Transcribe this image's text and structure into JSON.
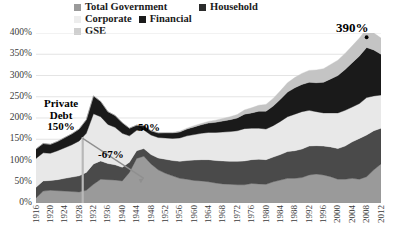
{
  "legend": {
    "items": [
      {
        "label": "Total Government",
        "color": "#9a9a9a",
        "key": "total_government"
      },
      {
        "label": "Household",
        "color": "#4a4a4a",
        "key": "household"
      },
      {
        "label": "Corporate",
        "color": "#e8e8e8",
        "key": "corporate"
      },
      {
        "label": "Financial",
        "color": "#1a1a1a",
        "key": "financial"
      },
      {
        "label": "GSE",
        "color": "#c4c4c4",
        "key": "gse"
      }
    ]
  },
  "annotations": [
    {
      "name": "private-debt-label",
      "text": "Private\nDebt\n150%"
    },
    {
      "name": "drop-label",
      "text": "-67%"
    },
    {
      "name": "fifty-label",
      "text": "50%"
    },
    {
      "name": "peak-label",
      "text": "390%"
    }
  ],
  "chart_data": {
    "type": "area",
    "title": "",
    "xlabel": "",
    "ylabel": "",
    "ylim": [
      0,
      400
    ],
    "ytick_labels": [
      "0%",
      "50%",
      "100%",
      "150%",
      "200%",
      "250%",
      "300%",
      "350%",
      "400%"
    ],
    "ytick_values": [
      0,
      50,
      100,
      150,
      200,
      250,
      300,
      350,
      400
    ],
    "grid": true,
    "legend_position": "top",
    "stacked": true,
    "stack_order_bottom_to_top": [
      "total_government",
      "household",
      "corporate",
      "financial",
      "gse"
    ],
    "x": [
      1916,
      1918,
      1920,
      1922,
      1924,
      1926,
      1928,
      1930,
      1932,
      1934,
      1936,
      1938,
      1940,
      1942,
      1944,
      1946,
      1948,
      1950,
      1952,
      1954,
      1956,
      1958,
      1960,
      1962,
      1964,
      1966,
      1968,
      1970,
      1972,
      1974,
      1976,
      1978,
      1980,
      1982,
      1984,
      1986,
      1988,
      1990,
      1992,
      1994,
      1996,
      1998,
      2000,
      2002,
      2004,
      2006,
      2008,
      2010,
      2012
    ],
    "xtick_labels": [
      "1916",
      "1920",
      "1924",
      "1928",
      "1932",
      "1936",
      "1940",
      "1944",
      "1948",
      "1952",
      "1956",
      "1960",
      "1964",
      "1968",
      "1972",
      "1976",
      "1980",
      "1984",
      "1988",
      "1992",
      "1996",
      "2000",
      "2004",
      "2008",
      "2012"
    ],
    "series": [
      {
        "name": "Total Government",
        "color": "#9a9a9a",
        "values": [
          12,
          28,
          30,
          29,
          28,
          27,
          26,
          30,
          44,
          56,
          55,
          54,
          52,
          72,
          105,
          110,
          92,
          78,
          70,
          64,
          58,
          56,
          53,
          52,
          50,
          47,
          45,
          44,
          43,
          43,
          46,
          45,
          44,
          50,
          54,
          58,
          58,
          60,
          66,
          68,
          66,
          62,
          56,
          56,
          58,
          56,
          62,
          78,
          92
        ]
      },
      {
        "name": "Household",
        "color": "#4a4a4a",
        "values": [
          25,
          24,
          23,
          26,
          30,
          34,
          38,
          42,
          48,
          43,
          38,
          36,
          32,
          24,
          18,
          18,
          22,
          28,
          33,
          36,
          40,
          44,
          48,
          50,
          52,
          53,
          54,
          54,
          55,
          56,
          56,
          58,
          58,
          58,
          60,
          63,
          65,
          67,
          68,
          67,
          68,
          70,
          72,
          78,
          86,
          96,
          98,
          92,
          84
        ]
      },
      {
        "name": "Corporate",
        "color": "#e8e8e8",
        "values": [
          68,
          66,
          64,
          68,
          72,
          76,
          82,
          92,
          118,
          104,
          92,
          88,
          80,
          62,
          48,
          44,
          46,
          48,
          50,
          52,
          55,
          58,
          60,
          62,
          64,
          66,
          68,
          70,
          72,
          76,
          74,
          73,
          72,
          74,
          78,
          82,
          86,
          88,
          84,
          80,
          78,
          80,
          84,
          84,
          82,
          82,
          88,
          82,
          78
        ]
      },
      {
        "name": "Financial",
        "color": "#1a1a1a",
        "values": [
          22,
          22,
          21,
          22,
          24,
          26,
          28,
          32,
          42,
          36,
          30,
          28,
          25,
          18,
          12,
          10,
          10,
          11,
          12,
          13,
          14,
          16,
          18,
          20,
          22,
          24,
          26,
          28,
          30,
          34,
          36,
          40,
          42,
          46,
          52,
          58,
          62,
          64,
          66,
          68,
          72,
          80,
          88,
          96,
          104,
          112,
          118,
          108,
          96
        ]
      },
      {
        "name": "GSE",
        "color": "#c4c4c4",
        "values": [
          0,
          0,
          0,
          0,
          0,
          0,
          0,
          0,
          0,
          0,
          0,
          0,
          0,
          0,
          0,
          0,
          0,
          0,
          1,
          1,
          2,
          2,
          3,
          3,
          4,
          5,
          6,
          7,
          8,
          10,
          12,
          14,
          16,
          18,
          20,
          22,
          24,
          26,
          28,
          30,
          32,
          34,
          36,
          38,
          40,
          42,
          44,
          40,
          38
        ]
      }
    ],
    "total_peak": {
      "year": 2008,
      "value": 390,
      "label": "390%"
    },
    "private_debt_1929": {
      "value": 150,
      "label": "Private\nDebt\n150%"
    },
    "private_debt_1945": {
      "value": 50,
      "label": "50%"
    },
    "private_debt_decline": {
      "value": -67,
      "label": "-67%"
    }
  }
}
